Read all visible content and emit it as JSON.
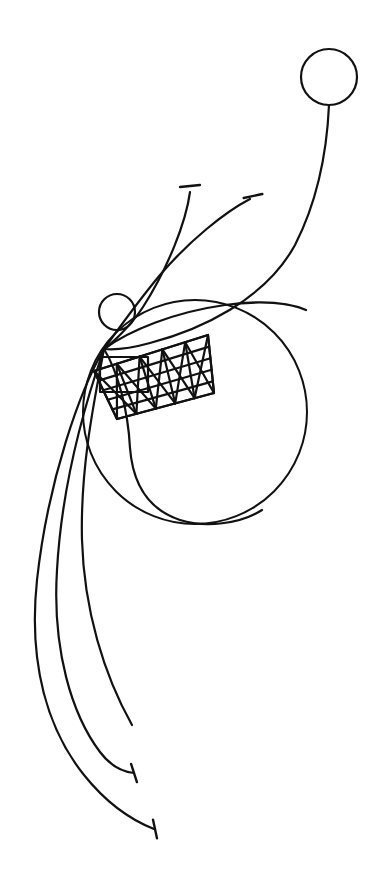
{
  "artwork": {
    "title": "Abstract Line Drawing",
    "medium": "pen-and-ink line drawing",
    "background_color": "#ffffff",
    "stroke_color": "#111111",
    "canvas": {
      "width": 380,
      "height": 883
    }
  },
  "shapes": {
    "large_circle": {
      "name": "large-circle",
      "cx": 195,
      "cy": 412,
      "r": 112,
      "stroke_width": 2.0
    },
    "top_circle": {
      "name": "top-right-circle",
      "cx": 329,
      "cy": 77,
      "r": 28,
      "stroke_width": 2.2
    },
    "node_circle": {
      "name": "small-node-circle",
      "cx": 117,
      "cy": 312,
      "r": 18,
      "stroke_width": 2.2
    },
    "convergence_point": {
      "x": 104,
      "y": 349
    }
  },
  "lattice": {
    "name": "crosshatched-band",
    "tilt_degrees": -28,
    "band_corners": [
      {
        "x": 208,
        "y": 335
      },
      {
        "x": 214,
        "y": 393
      },
      {
        "x": 117,
        "y": 419
      },
      {
        "x": 94,
        "y": 371
      }
    ],
    "stroke_width": 2.2,
    "diagonal_count_a": 5,
    "diagonal_count_b": 5,
    "inner_rectangle": {
      "name": "axis-aligned-rectangle",
      "x": 100,
      "y": 357,
      "width": 48,
      "height": 35
    }
  },
  "curves": [
    {
      "name": "stem-to-top-circle",
      "stroke_width": 2.2,
      "path": "M 329 105 C 327 150 318 200 295 245 C 265 300 200 330 150 343 C 132 348 115 350 104 349"
    },
    {
      "name": "stem-upper-left-short",
      "stroke_width": 2.2,
      "path": "M 190 192 C 186 222 168 268 143 307 C 130 327 112 343 104 349"
    },
    {
      "name": "stem-upper-right-short",
      "stroke_width": 2.2,
      "path": "M 250 199 C 225 212 190 240 160 275 C 135 305 112 338 104 349"
    },
    {
      "name": "big-circle-overlap-arc",
      "stroke_width": 2.2,
      "path": "M 104 349 C 130 330 175 312 225 305 C 262 300 290 303 306 310"
    },
    {
      "name": "stem-down-outer-left",
      "stroke_width": 2.2,
      "path": "M 104 349 C 80 390 48 480 37 580 C 28 665 48 730 84 775 C 104 800 126 818 154 829"
    },
    {
      "name": "stem-down-inner-left",
      "stroke_width": 2.2,
      "path": "M 104 349 C 88 395 62 480 57 570 C 52 650 72 715 100 752 C 112 768 124 772 134 773"
    },
    {
      "name": "stem-down-inner-right",
      "stroke_width": 2.2,
      "path": "M 104 349 C 96 392 80 465 82 540 C 84 610 104 675 132 725"
    },
    {
      "name": "inner-hook-arc",
      "stroke_width": 2.2,
      "path": "M 104 349 C 118 372 128 410 130 448 C 133 487 150 510 180 520 C 205 528 240 524 262 510"
    }
  ],
  "terminals": [
    {
      "name": "t-terminal-upper-left",
      "x": 190,
      "y": 186,
      "angle": -6,
      "length": 20,
      "stroke_width": 2.4
    },
    {
      "name": "t-terminal-upper-right",
      "x": 253,
      "y": 196,
      "angle": -12,
      "length": 19,
      "stroke_width": 2.4
    },
    {
      "name": "t-terminal-lower-upper",
      "x": 134,
      "y": 773,
      "angle": 72,
      "length": 19,
      "stroke_width": 2.4
    },
    {
      "name": "t-terminal-lower-lower",
      "x": 155,
      "y": 829,
      "angle": 78,
      "length": 19,
      "stroke_width": 2.4
    }
  ]
}
